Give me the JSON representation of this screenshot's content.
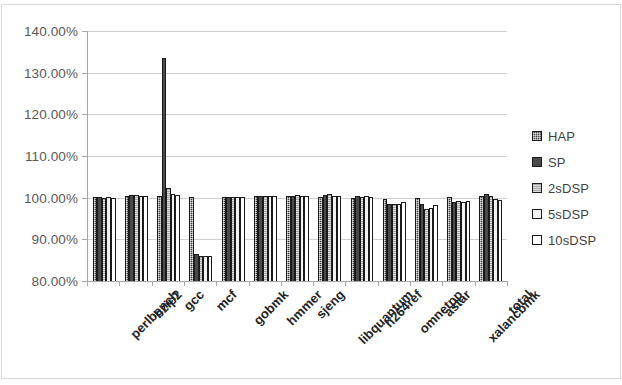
{
  "chart_data": {
    "type": "bar",
    "title": "",
    "subtitle": "",
    "xlabel": "",
    "ylabel": "",
    "ylim": [
      80,
      140
    ],
    "ytick_values": [
      80,
      90,
      100,
      110,
      120,
      130,
      140
    ],
    "ytick_labels": [
      "80.00%",
      "90.00%",
      "100.00%",
      "110.00%",
      "120.00%",
      "130.00%",
      "140.00%"
    ],
    "grid": true,
    "legend_position": "right",
    "categories": [
      "perlbench",
      "bzip2",
      "gcc",
      "mcf",
      "gobmk",
      "hmmer",
      "sjeng",
      "libquantum",
      "h264ref",
      "omnetpp",
      "astar",
      "xalancbmk",
      "total"
    ],
    "series": [
      {
        "name": "HAP",
        "color": "#404040",
        "values": [
          100.2,
          100.3,
          100.3,
          100.2,
          100.2,
          100.3,
          100.3,
          100.2,
          100.0,
          99.8,
          100.0,
          100.2,
          100.5
        ]
      },
      {
        "name": "SP",
        "color": "#4a4a4a",
        "values": [
          100.2,
          100.6,
          133.6,
          86.6,
          100.2,
          100.5,
          100.4,
          100.6,
          100.4,
          98.5,
          98.4,
          99.0,
          100.9
        ]
      },
      {
        "name": "2sDSP",
        "color": "#a8a8a8",
        "values": [
          100.0,
          100.7,
          102.4,
          86.0,
          100.1,
          100.3,
          100.6,
          100.8,
          100.2,
          98.4,
          97.4,
          99.1,
          100.4
        ]
      },
      {
        "name": "5sDSP",
        "color": "#f2f2f2",
        "values": [
          100.1,
          100.4,
          100.9,
          86.0,
          100.2,
          100.4,
          100.5,
          100.5,
          100.3,
          98.6,
          97.6,
          99.0,
          99.6
        ]
      },
      {
        "name": "10sDSP",
        "color": "#ffffff",
        "values": [
          100.0,
          100.3,
          100.6,
          86.1,
          100.1,
          100.3,
          100.4,
          100.3,
          100.1,
          98.9,
          98.2,
          99.1,
          99.4
        ]
      }
    ]
  },
  "legend": {
    "items": [
      {
        "label": "HAP"
      },
      {
        "label": "SP"
      },
      {
        "label": "2sDSP"
      },
      {
        "label": "5sDSP"
      },
      {
        "label": "10sDSP"
      }
    ]
  }
}
